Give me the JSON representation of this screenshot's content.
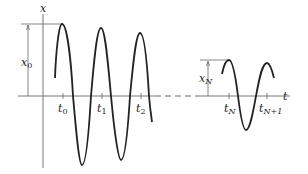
{
  "diagram": {
    "type": "oscillation-graph",
    "axes": {
      "vertical_label": "x",
      "horizontal_label": "t"
    },
    "amplitude_labels": {
      "initial": "x",
      "initial_sub": "0",
      "later": "x",
      "later_sub": "N"
    },
    "time_ticks": [
      {
        "main": "t",
        "sub": "0"
      },
      {
        "main": "t",
        "sub": "1"
      },
      {
        "main": "t",
        "sub": "2"
      },
      {
        "main": "t",
        "sub": "N"
      },
      {
        "main": "t",
        "sub": "N+1"
      }
    ],
    "colors": {
      "curve": "#222222",
      "axis": "#555555"
    }
  }
}
